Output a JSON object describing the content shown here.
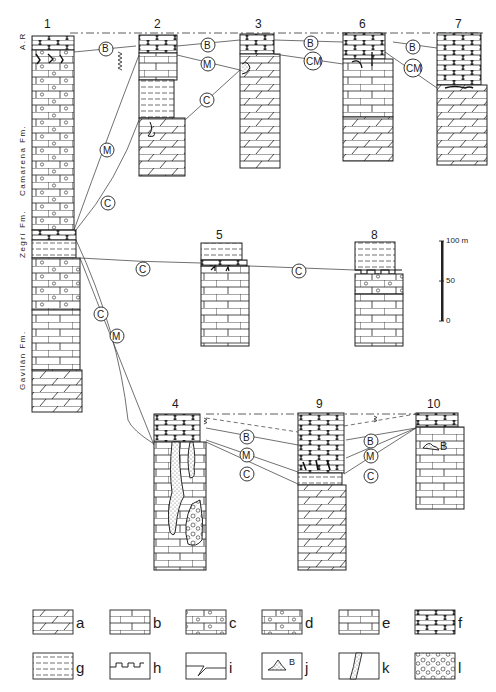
{
  "figure": {
    "type": "stratigraphic correlation diagram",
    "columns": [
      {
        "id": "1",
        "label": "1",
        "x": 32,
        "top": 34,
        "width": 38
      },
      {
        "id": "2",
        "label": "2",
        "x": 139,
        "top": 34,
        "width": 36
      },
      {
        "id": "3",
        "label": "3",
        "x": 240,
        "top": 34,
        "width": 36
      },
      {
        "id": "4",
        "label": "4",
        "x": 154,
        "top": 414,
        "width": 52
      },
      {
        "id": "5",
        "label": "5",
        "x": 200,
        "top": 243,
        "width": 48
      },
      {
        "id": "6",
        "label": "6",
        "x": 343,
        "top": 34,
        "width": 50
      },
      {
        "id": "7",
        "label": "7",
        "x": 437,
        "top": 33,
        "width": 50
      },
      {
        "id": "8",
        "label": "8",
        "x": 355,
        "top": 242,
        "width": 48
      },
      {
        "id": "9",
        "label": "9",
        "x": 298,
        "top": 413,
        "width": 48
      },
      {
        "id": "10",
        "label": "10",
        "x": 416,
        "top": 413,
        "width": 48
      }
    ],
    "formations": [
      {
        "label": "A.R",
        "column": "1"
      },
      {
        "label": "Camarena Fm.",
        "column": "1"
      },
      {
        "label": "Zegrí Fm.",
        "column": "1"
      },
      {
        "label": "Gavilán Fm.",
        "column": "1"
      }
    ],
    "correlation_markers": [
      {
        "label": "B",
        "column_pair": "1-2"
      },
      {
        "label": "M",
        "column_pair": "1-2"
      },
      {
        "label": "C",
        "column_pair": "1-2"
      },
      {
        "label": "B",
        "column_pair": "2-3"
      },
      {
        "label": "M",
        "column_pair": "2-3"
      },
      {
        "label": "C",
        "column_pair": "2-3"
      },
      {
        "label": "B",
        "column_pair": "3-6"
      },
      {
        "label": "CM",
        "column_pair": "3-6"
      },
      {
        "label": "B",
        "column_pair": "6-7"
      },
      {
        "label": "CM",
        "column_pair": "6-7"
      },
      {
        "label": "C",
        "column_pair": "1-5"
      },
      {
        "label": "C",
        "column_pair": "5-8"
      },
      {
        "label": "C",
        "column_pair": "1-4"
      },
      {
        "label": "M",
        "column_pair": "1-4"
      },
      {
        "label": "B",
        "column_pair": "4-9"
      },
      {
        "label": "M",
        "column_pair": "4-9"
      },
      {
        "label": "C",
        "column_pair": "4-9"
      },
      {
        "label": "B",
        "column_pair": "9-10"
      },
      {
        "label": "M",
        "column_pair": "9-10"
      },
      {
        "label": "C",
        "column_pair": "9-10"
      }
    ],
    "inline_annotations": [
      {
        "label": "B",
        "column": "10"
      }
    ],
    "scale_bar": {
      "labels": [
        "100 m",
        "50",
        "0"
      ],
      "max": 100,
      "unit": "m"
    }
  },
  "legend": {
    "items": [
      {
        "key": "a",
        "pattern": "dolostone (oblique-slashed blocks)"
      },
      {
        "key": "b",
        "pattern": "limestone (brick)"
      },
      {
        "key": "c",
        "pattern": "oolitic limestone (brick with large ooids)"
      },
      {
        "key": "d",
        "pattern": "oolitic/peloidal limestone (brick with small ooids)"
      },
      {
        "key": "e",
        "pattern": "limestone with vertical marks"
      },
      {
        "key": "f",
        "pattern": "nodular limestone (brick with I-shaped marks)"
      },
      {
        "key": "g",
        "pattern": "marl (dashed lines)"
      },
      {
        "key": "h",
        "pattern": "hardground (notched surface)"
      },
      {
        "key": "i",
        "pattern": "discontinuity surface with fissure"
      },
      {
        "key": "j",
        "pattern": "breccia pocket (B)",
        "inset_label": "B"
      },
      {
        "key": "k",
        "pattern": "neptunian dyke (stippled fissure)"
      },
      {
        "key": "l",
        "pattern": "breccia / conglomerate (clasts)"
      }
    ]
  }
}
